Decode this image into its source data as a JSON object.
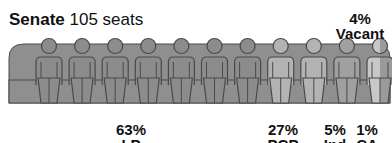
{
  "chart_data": {
    "type": "pictogram",
    "title": "Senate",
    "subtitle": "105 seats",
    "total_seats": 105,
    "icon_count": 11,
    "series": [
      {
        "name": "LP",
        "percent": 63,
        "label": "63%",
        "color": "#8c8c8c",
        "icons": 7
      },
      {
        "name": "PCP",
        "percent": 27,
        "label": "27%",
        "color": "#b3b3b3",
        "icons": 2
      },
      {
        "name": "Ind",
        "percent": 5,
        "label": "5%",
        "color": "#a0a0a0",
        "icons": 1
      },
      {
        "name": "CA",
        "percent": 1,
        "label": "1%",
        "color": "#c8c8c8",
        "icons": 0.5
      },
      {
        "name": "Vacant",
        "percent": 4,
        "label": "4%",
        "color": "#9a9a9a",
        "icons": 0.5
      }
    ],
    "bench_color": "#8f8f8f",
    "outline_color": "#4a4a4a"
  }
}
